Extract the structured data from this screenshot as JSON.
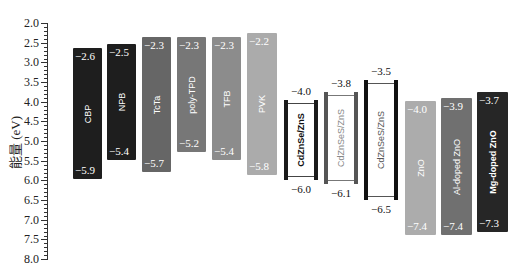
{
  "chart_data": {
    "type": "floating-bar",
    "title": "",
    "xlabel": "",
    "ylabel": "能量 (eV)",
    "ylim": [
      2.0,
      8.0
    ],
    "y_inverted": true,
    "y_ticks": [
      "2.0",
      "2.5",
      "3.0",
      "3.5",
      "4.0",
      "4.5",
      "5.0",
      "5.5",
      "6.0",
      "6.5",
      "7.0",
      "7.5",
      "8.0"
    ],
    "grid": false,
    "legend": null,
    "categories": [
      "CBP",
      "NPB",
      "TcTa",
      "poly-TPD",
      "TFB",
      "PVK",
      "CdZnSe/ZnS",
      "CdZnSeS/ZnS",
      "CdZnSeS/ZnS",
      "ZnO",
      "Al-doped ZnO",
      "Mg-doped ZnO"
    ],
    "series": [
      {
        "name": "LUMO",
        "values": [
          -2.6,
          -2.5,
          -2.3,
          -2.3,
          -2.3,
          -2.2,
          -4.0,
          -3.8,
          -3.5,
          -4.0,
          -3.9,
          -3.7
        ]
      },
      {
        "name": "HOMO",
        "values": [
          -5.9,
          -5.4,
          -5.7,
          -5.2,
          -5.4,
          -5.8,
          -6.0,
          -6.1,
          -6.5,
          -7.4,
          -7.4,
          -7.3
        ]
      }
    ]
  },
  "axis": {
    "label": "能量 (eV)",
    "ticks": [
      "2.0",
      "2.5",
      "3.0",
      "3.5",
      "4.0",
      "4.5",
      "5.0",
      "5.5",
      "6.0",
      "6.5",
      "7.0",
      "7.5",
      "8.0"
    ]
  },
  "bars": [
    {
      "name": "CBP",
      "top": "−2.6",
      "bottom": "−5.9",
      "color": "#1e1e1e"
    },
    {
      "name": "NPB",
      "top": "−2.5",
      "bottom": "−5.4",
      "color": "#1e1e1e"
    },
    {
      "name": "TcTa",
      "top": "−2.3",
      "bottom": "−5.7",
      "color": "#666666"
    },
    {
      "name": "poly-TPD",
      "top": "−2.3",
      "bottom": "−5.2",
      "color": "#777777"
    },
    {
      "name": "TFB",
      "top": "−2.3",
      "bottom": "−5.4",
      "color": "#8c8c8c"
    },
    {
      "name": "PVK",
      "top": "−2.2",
      "bottom": "−5.8",
      "color": "#ababab"
    },
    {
      "name": "ZnO",
      "top": "−4.0",
      "bottom": "−7.4",
      "color": "#acacac"
    },
    {
      "name": "Al-doped ZnO",
      "top": "−3.9",
      "bottom": "−7.4",
      "color": "#707070"
    },
    {
      "name": "Mg-doped ZnO",
      "top": "−3.7",
      "bottom": "−7.3",
      "color": "#262626"
    }
  ],
  "qds": [
    {
      "name": "CdZnSe/ZnS",
      "top": "−4.0",
      "bottom": "−6.0",
      "side_color": "#1a1a1a",
      "text_color": "#111111"
    },
    {
      "name": "CdZnSeS/ZnS",
      "top": "−3.8",
      "bottom": "−6.1",
      "side_color": "#555555",
      "text_color": "#888888"
    },
    {
      "name": "CdZnSeS/ZnS",
      "top": "−3.5",
      "bottom": "−6.5",
      "side_color": "#111111",
      "text_color": "#555555"
    }
  ]
}
